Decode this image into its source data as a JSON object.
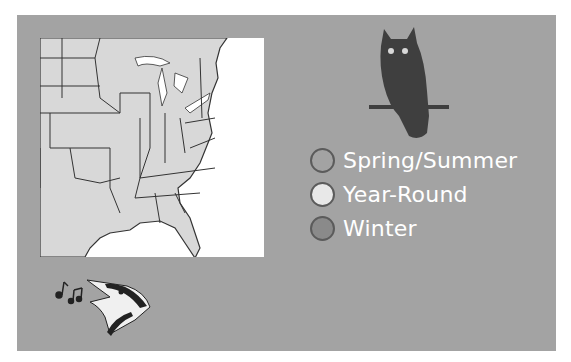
{
  "range_map": {
    "region": "Eastern United States",
    "legend": [
      {
        "label": "Spring/Summer",
        "color": "#a3a3a3"
      },
      {
        "label": "Year-Round",
        "color": "#e8e8e8"
      },
      {
        "label": "Winter",
        "color": "#8a8a8a"
      }
    ]
  },
  "icons": {
    "owl": "owl-silhouette-icon",
    "bird": "singing-bird-icon",
    "notes": "music-notes-icon"
  },
  "colors": {
    "card_bg": "#a3a3a3",
    "land": "#d8d8d8",
    "water": "#ffffff",
    "owl": "#3f3f3f",
    "text": "#ffffff"
  }
}
